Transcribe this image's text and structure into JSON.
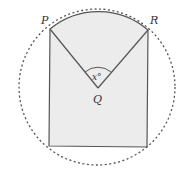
{
  "diagram": {
    "labels": {
      "P": "P",
      "R": "R",
      "Q": "Q",
      "angle": "x°"
    },
    "colors": {
      "fill": "#ececec",
      "stroke": "#555555",
      "dashed": "#555555"
    }
  }
}
